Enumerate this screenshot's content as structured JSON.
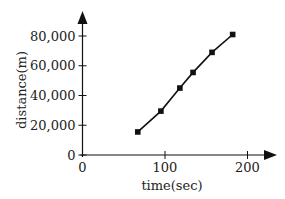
{
  "chart_data": {
    "type": "line",
    "title": "",
    "xlabel": "time(sec)",
    "ylabel": "distance(m)",
    "xlim": [
      0,
      230
    ],
    "ylim": [
      0,
      95000
    ],
    "grid": false,
    "legend": null,
    "x_ticks": [
      0,
      100,
      200
    ],
    "x_tick_labels": [
      "0",
      "100",
      "200"
    ],
    "y_ticks": [
      0,
      20000,
      40000,
      60000,
      80000
    ],
    "y_tick_labels": [
      "0",
      "20,000",
      "40,000",
      "60,000",
      "80,000"
    ],
    "series": [
      {
        "name": "distance",
        "marker": "square",
        "color": "#111111",
        "x": [
          67,
          95,
          118,
          134,
          157,
          182
        ],
        "values": [
          15500,
          29500,
          45000,
          55500,
          69000,
          81000
        ]
      }
    ]
  }
}
